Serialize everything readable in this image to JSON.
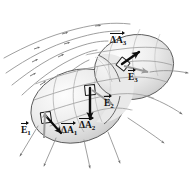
{
  "figure": {
    "kind": "physics-diagram",
    "background_color": "#ffffff"
  },
  "surface": {
    "name": "closed-gaussian-surface",
    "shape": "peanut",
    "fill_light": "#fefefe",
    "fill_mid": "#e3e3e3",
    "fill_dark": "#b8b8b8",
    "outline_color": "#4a4a4a"
  },
  "field_lines": {
    "name": "electric-field-lines",
    "color": "#8a8a8a",
    "count": 9,
    "arrow_color": "#6e6e6e"
  },
  "patches": [
    {
      "id": "patch-1",
      "area_label": "ΔA",
      "area_sub": "1",
      "field_label": "E",
      "field_sub": "1",
      "area_label_x": 60,
      "area_label_y": 129,
      "field_label_x": 22,
      "field_label_y": 128
    },
    {
      "id": "patch-2",
      "area_label": "ΔA",
      "area_sub": "2",
      "field_label": "E",
      "field_sub": "2",
      "area_label_x": 81,
      "area_label_y": 126,
      "field_label_x": 104,
      "field_label_y": 103
    },
    {
      "id": "patch-3",
      "area_label": "ΔA",
      "area_sub": "3",
      "field_label": "E",
      "field_sub": "3",
      "area_label_x": 110,
      "area_label_y": 43,
      "field_label_x": 128,
      "field_label_y": 76
    }
  ],
  "caption": {
    "text": ""
  }
}
